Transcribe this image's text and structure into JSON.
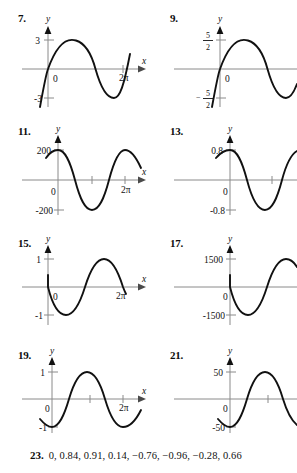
{
  "document": {
    "type": "textbook-answer-key",
    "background_color": "#ffffff",
    "ink_color": "#111111",
    "axis_color": "#8a8a8a"
  },
  "problems": [
    {
      "number": "7.",
      "y_axis_label": "y",
      "x_axis_label": "x",
      "origin_label": "0",
      "y_max_label": "3",
      "y_min_label": "-3",
      "x_end_label": "2π",
      "curve": "sine",
      "amplitude": 3,
      "cycles": 1
    },
    {
      "number": "9.",
      "y_axis_label": "y",
      "x_axis_label": "x",
      "origin_label": "0",
      "y_max_label": "5/2",
      "y_min_label": "-5/2",
      "x_end_label": "",
      "curve": "sine",
      "amplitude": 2.5,
      "cycles": 1
    },
    {
      "number": "11.",
      "y_axis_label": "y",
      "x_axis_label": "x",
      "origin_label": "0",
      "y_max_label": "200",
      "y_min_label": "-200",
      "x_end_label": "2π",
      "curve": "cosine",
      "amplitude": 200,
      "cycles": 1.5
    },
    {
      "number": "13.",
      "y_axis_label": "y",
      "x_axis_label": "x",
      "origin_label": "0",
      "y_max_label": "0.8",
      "y_min_label": "-0.8",
      "x_end_label": "",
      "curve": "cosine",
      "amplitude": 0.8,
      "cycles": 1.5
    },
    {
      "number": "15.",
      "y_axis_label": "y",
      "x_axis_label": "x",
      "origin_label": "0",
      "y_max_label": "1",
      "y_min_label": "-1",
      "x_end_label": "2π",
      "curve": "negative-sine",
      "amplitude": 1,
      "cycles": 1
    },
    {
      "number": "17.",
      "y_axis_label": "y",
      "x_axis_label": "x",
      "origin_label": "0",
      "y_max_label": "1500",
      "y_min_label": "-1500",
      "x_end_label": "",
      "curve": "negative-sine",
      "amplitude": 1500,
      "cycles": 1
    },
    {
      "number": "19.",
      "y_axis_label": "y",
      "x_axis_label": "x",
      "origin_label": "0",
      "y_max_label": "1",
      "y_min_label": "-1",
      "x_end_label": "2π",
      "curve": "negative-cosine",
      "amplitude": 1,
      "cycles": 1.5
    },
    {
      "number": "21.",
      "y_axis_label": "y",
      "x_axis_label": "x",
      "origin_label": "0",
      "y_max_label": "50",
      "y_min_label": "-50",
      "x_end_label": "",
      "curve": "negative-cosine",
      "amplitude": 50,
      "cycles": 1.5
    }
  ],
  "answer_23": {
    "number": "23.",
    "values": "0, 0.84, 0.91, 0.14, −0.76, −0.96, −0.28, 0.66"
  }
}
